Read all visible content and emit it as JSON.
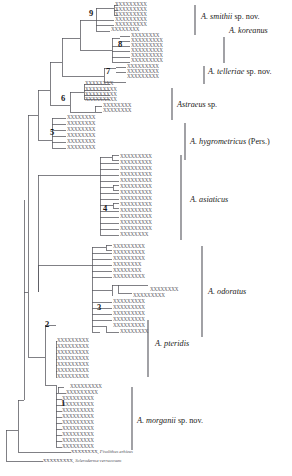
{
  "figure": {
    "type": "phylogenetic-cladogram",
    "background_color": "#ffffff",
    "branch_color": "#55555c",
    "tip_label_color": "#5a5a62",
    "bracket_color": "#55555c"
  },
  "node_numbers": [
    {
      "id": "node-9",
      "label": "9",
      "x": 89,
      "y": 14
    },
    {
      "id": "node-8",
      "label": "8",
      "x": 118,
      "y": 45
    },
    {
      "id": "node-7",
      "label": "7",
      "x": 106,
      "y": 72
    },
    {
      "id": "node-6",
      "label": "6",
      "x": 61,
      "y": 99
    },
    {
      "id": "node-5",
      "label": "5",
      "x": 50,
      "y": 133
    },
    {
      "id": "node-4",
      "label": "4",
      "x": 103,
      "y": 209
    },
    {
      "id": "node-3",
      "label": "3",
      "x": 97,
      "y": 308
    },
    {
      "id": "node-2",
      "label": "2",
      "x": 45,
      "y": 325
    },
    {
      "id": "node-1",
      "label": "1",
      "x": 61,
      "y": 404
    }
  ],
  "clades": [
    {
      "id": "clade-smithii",
      "label_html": "<i>A. smithii</i> sp. nov.",
      "label_text": "A. smithii sp. nov.",
      "x": 201,
      "y": 17,
      "bar_x": 195,
      "bar_y1": 5,
      "bar_y2": 35
    },
    {
      "id": "clade-koreanus",
      "label_html": "<i>A. koreanus</i>",
      "label_text": "A. koreanus",
      "x": 229,
      "y": 31,
      "bar_x": 224,
      "bar_y1": 37,
      "bar_y2": 63
    },
    {
      "id": "clade-telleriae",
      "label_html": "<i>A. telleriae</i> sp. nov.",
      "label_text": "A. telleriae sp. nov.",
      "x": 208,
      "y": 72,
      "bar_x": 204,
      "bar_y1": 66,
      "bar_y2": 84
    },
    {
      "id": "clade-astraeus-sp",
      "label_html": "<i>Astraeus</i> sp.",
      "label_text": "Astraeus sp.",
      "x": 177,
      "y": 105,
      "bar_x": 172,
      "bar_y1": 88,
      "bar_y2": 120
    },
    {
      "id": "clade-hygrometricus",
      "label_html": "<i>A. hygrometricus</i> (Pers.)",
      "label_text": "A. hygrometricus (Pers.)",
      "x": 190,
      "y": 142,
      "bar_x": 185,
      "bar_y1": 123,
      "bar_y2": 160
    },
    {
      "id": "clade-asiaticus",
      "label_html": "<i>A. asiaticus</i>",
      "label_text": "A. asiaticus",
      "x": 190,
      "y": 200,
      "bar_x": 181,
      "bar_y1": 155,
      "bar_y2": 240
    },
    {
      "id": "clade-odoratus",
      "label_html": "<i>A. odoratus</i>",
      "label_text": "A. odoratus",
      "x": 208,
      "y": 292,
      "bar_x": 202,
      "bar_y1": 246,
      "bar_y2": 337
    },
    {
      "id": "clade-pteridis",
      "label_html": "<i>A. pteridis</i>",
      "label_text": "A. pteridis",
      "x": 155,
      "y": 344,
      "bar_x": 148,
      "bar_y1": 320,
      "bar_y2": 377
    },
    {
      "id": "clade-morganii",
      "label_html": "<i>A. morganii</i> sp. nov.",
      "label_text": "A. morganii sp. nov.",
      "x": 137,
      "y": 421,
      "bar_x": 132,
      "bar_y1": 387,
      "bar_y2": 450
    }
  ],
  "outgroups": [
    {
      "id": "outgroup-pisolithus",
      "tip_code": "XXXXXXXX,",
      "taxon": "Pisolithus arhizus",
      "x": 71,
      "y": 452
    },
    {
      "id": "outgroup-scleroderma",
      "tip_code": "XXXXXXXXX,",
      "taxon": "Scleroderma verrucosum",
      "x": 43,
      "y": 461
    }
  ],
  "tips": [
    {
      "id": "t1",
      "code": "XXXXXXXXX",
      "x": 115,
      "y": 5
    },
    {
      "id": "t2",
      "code": "XXXXXXXXX",
      "x": 115,
      "y": 10
    },
    {
      "id": "t3",
      "code": "XXXXXXXXX",
      "x": 115,
      "y": 15
    },
    {
      "id": "t4",
      "code": "XXXXXXXXX",
      "x": 115,
      "y": 20
    },
    {
      "id": "t5",
      "code": "XXXXXXXXX",
      "x": 115,
      "y": 25
    },
    {
      "id": "t6",
      "code": "XXXXXXXX",
      "x": 111,
      "y": 30
    },
    {
      "id": "t7",
      "code": "XXXXXXXX",
      "x": 131,
      "y": 36
    },
    {
      "id": "t8",
      "code": "XXXXXXXXX",
      "x": 131,
      "y": 41
    },
    {
      "id": "t9",
      "code": "XXXXXXXXX",
      "x": 131,
      "y": 46
    },
    {
      "id": "t10",
      "code": "XXXXXXXXX",
      "x": 131,
      "y": 51
    },
    {
      "id": "t11",
      "code": "XXXXXXXXX",
      "x": 131,
      "y": 56
    },
    {
      "id": "t12",
      "code": "XXXXXXXXX",
      "x": 131,
      "y": 61
    },
    {
      "id": "t13",
      "code": "XXXXXXXXX",
      "x": 127,
      "y": 67
    },
    {
      "id": "t14",
      "code": "XXXXXXXXX",
      "x": 127,
      "y": 72
    },
    {
      "id": "t15",
      "code": "XXXXXXXXX",
      "x": 127,
      "y": 77
    },
    {
      "id": "t16",
      "code": "XXXXXXXX",
      "x": 85,
      "y": 84
    },
    {
      "id": "t17",
      "code": "XXXXXXXXX",
      "x": 85,
      "y": 90
    },
    {
      "id": "t18",
      "code": "XXXXXXXXX",
      "x": 85,
      "y": 95
    },
    {
      "id": "t19",
      "code": "XXXXXXXXX",
      "x": 85,
      "y": 100
    },
    {
      "id": "t20",
      "code": "XXXXXXXX",
      "x": 103,
      "y": 106
    },
    {
      "id": "t21",
      "code": "XXXXXXXX",
      "x": 103,
      "y": 111
    },
    {
      "id": "t22",
      "code": "XXXXXXXX",
      "x": 67,
      "y": 118
    },
    {
      "id": "t23",
      "code": "XXXXXXXX",
      "x": 67,
      "y": 124
    },
    {
      "id": "t24",
      "code": "XXXXXXXX",
      "x": 67,
      "y": 130
    },
    {
      "id": "t25",
      "code": "XXXXXXXX",
      "x": 67,
      "y": 136
    },
    {
      "id": "t26",
      "code": "XXXXXXXX",
      "x": 67,
      "y": 142
    },
    {
      "id": "t27",
      "code": "XXXXXXXX",
      "x": 67,
      "y": 148
    },
    {
      "id": "t28",
      "code": "XXXXXXXXX",
      "x": 120,
      "y": 157
    },
    {
      "id": "t29",
      "code": "XXXXXXXXX",
      "x": 120,
      "y": 163
    },
    {
      "id": "t30",
      "code": "XXXXXXXXX",
      "x": 120,
      "y": 169
    },
    {
      "id": "t31",
      "code": "XXXXXXXXX",
      "x": 120,
      "y": 175
    },
    {
      "id": "t32",
      "code": "XXXXXXXXX",
      "x": 120,
      "y": 181
    },
    {
      "id": "t33",
      "code": "XXXXXXXXX",
      "x": 120,
      "y": 187
    },
    {
      "id": "t34",
      "code": "XXXXXXXXX",
      "x": 120,
      "y": 193
    },
    {
      "id": "t35",
      "code": "XXXXXXXXX",
      "x": 120,
      "y": 199
    },
    {
      "id": "t36",
      "code": "XXXXXXXXX",
      "x": 120,
      "y": 205
    },
    {
      "id": "t37",
      "code": "XXXXXXXXX",
      "x": 120,
      "y": 211
    },
    {
      "id": "t38",
      "code": "XXXXXXXXX",
      "x": 120,
      "y": 217
    },
    {
      "id": "t39",
      "code": "XXXXXXXXX",
      "x": 120,
      "y": 223
    },
    {
      "id": "t40",
      "code": "XXXXXXXXX",
      "x": 120,
      "y": 229
    },
    {
      "id": "t41",
      "code": "XXXXXXXX",
      "x": 120,
      "y": 235
    },
    {
      "id": "t42",
      "code": "XXXXXXXXX",
      "x": 113,
      "y": 247
    },
    {
      "id": "t43",
      "code": "XXXXXXXXX",
      "x": 113,
      "y": 253
    },
    {
      "id": "t44",
      "code": "XXXXXXXXX",
      "x": 113,
      "y": 259
    },
    {
      "id": "t45",
      "code": "XXXXXXXX",
      "x": 113,
      "y": 265
    },
    {
      "id": "t46",
      "code": "XXXXXXXX",
      "x": 113,
      "y": 271
    },
    {
      "id": "t47",
      "code": "XXXXXXXXX",
      "x": 113,
      "y": 277
    },
    {
      "id": "t48",
      "code": "XXXXXXXX",
      "x": 150,
      "y": 290
    },
    {
      "id": "t49",
      "code": "XXXXXXXXX",
      "x": 133,
      "y": 296
    },
    {
      "id": "t50",
      "code": "XXXXXXXXX",
      "x": 113,
      "y": 302
    },
    {
      "id": "t51",
      "code": "XXXXXXXXX",
      "x": 113,
      "y": 308
    },
    {
      "id": "t52",
      "code": "XXXXXXXXX",
      "x": 113,
      "y": 314
    },
    {
      "id": "t53",
      "code": "XXXXXXXXX",
      "x": 113,
      "y": 320
    },
    {
      "id": "t54",
      "code": "XXXXXXXXX",
      "x": 113,
      "y": 326
    },
    {
      "id": "t55",
      "code": "XXXXXXXX",
      "x": 120,
      "y": 332
    },
    {
      "id": "t56",
      "code": "XXXXXXXXX",
      "x": 57,
      "y": 341
    },
    {
      "id": "t57",
      "code": "XXXXXXXXX",
      "x": 57,
      "y": 347
    },
    {
      "id": "t58",
      "code": "XXXXXXXXX",
      "x": 57,
      "y": 353
    },
    {
      "id": "t59",
      "code": "XXXXXXXXX",
      "x": 57,
      "y": 359
    },
    {
      "id": "t60",
      "code": "XXXXXXXXX",
      "x": 57,
      "y": 365
    },
    {
      "id": "t61",
      "code": "XXXXXXXXX",
      "x": 57,
      "y": 371
    },
    {
      "id": "t62",
      "code": "XXXXXXXXX",
      "x": 57,
      "y": 377
    },
    {
      "id": "t63",
      "code": "XXXXXXXXX",
      "x": 70,
      "y": 387
    },
    {
      "id": "t64",
      "code": "XXXXXXXXX",
      "x": 66,
      "y": 393
    },
    {
      "id": "t65",
      "code": "XXXXXXXXX",
      "x": 62,
      "y": 399
    },
    {
      "id": "t66",
      "code": "XXXXXXXXX",
      "x": 62,
      "y": 405
    },
    {
      "id": "t67",
      "code": "XXXXXXXXX",
      "x": 62,
      "y": 411
    },
    {
      "id": "t68",
      "code": "XXXXXXXXX",
      "x": 62,
      "y": 417
    },
    {
      "id": "t69",
      "code": "XXXXXXXXX",
      "x": 62,
      "y": 423
    },
    {
      "id": "t70",
      "code": "XXXXXXXXX",
      "x": 62,
      "y": 429
    },
    {
      "id": "t71",
      "code": "XXXXXXXXX",
      "x": 62,
      "y": 435
    },
    {
      "id": "t72",
      "code": "XXXXXXXXX",
      "x": 62,
      "y": 441
    },
    {
      "id": "t73",
      "code": "XXXXXXXXX",
      "x": 62,
      "y": 447
    }
  ],
  "branches": [
    {
      "d": "M6 430 L6 461"
    },
    {
      "d": "M6 461 L43 461"
    },
    {
      "d": "M6 430 L18 430"
    },
    {
      "d": "M18 400 L18 452"
    },
    {
      "d": "M18 452 L71 452"
    },
    {
      "d": "M18 400 L24 400"
    },
    {
      "d": "M24 292 L24 400"
    },
    {
      "d": "M24 292 L28 292"
    },
    {
      "d": "M28 292 L28 357"
    },
    {
      "d": "M28 357 L45 357"
    },
    {
      "d": "M45 325 L45 385"
    },
    {
      "d": "M45 325 L56 325"
    },
    {
      "d": "M56 341 L56 377"
    },
    {
      "d": "M56 341 L57 341"
    },
    {
      "d": "M56 347 L57 347"
    },
    {
      "d": "M56 353 L57 353"
    },
    {
      "d": "M56 359 L57 359"
    },
    {
      "d": "M56 365 L57 365"
    },
    {
      "d": "M56 371 L57 371"
    },
    {
      "d": "M56 377 L57 377"
    },
    {
      "d": "M45 385 L56 385"
    },
    {
      "d": "M56 385 L56 447"
    },
    {
      "d": "M56 393 L58 393"
    },
    {
      "d": "M58 387 L58 393"
    },
    {
      "d": "M58 387 L64 387"
    },
    {
      "d": "M58 393 L66 393"
    },
    {
      "d": "M56 399 L62 399"
    },
    {
      "d": "M56 405 L62 405"
    },
    {
      "d": "M56 411 L62 411"
    },
    {
      "d": "M56 417 L62 417"
    },
    {
      "d": "M56 423 L62 423"
    },
    {
      "d": "M56 429 L62 429"
    },
    {
      "d": "M56 435 L62 435"
    },
    {
      "d": "M56 441 L62 441"
    },
    {
      "d": "M56 447 L62 447"
    },
    {
      "d": "M28 115 L28 292"
    },
    {
      "d": "M28 115 L38 115"
    },
    {
      "d": "M38 90 L38 140"
    },
    {
      "d": "M38 140 L52 140"
    },
    {
      "d": "M52 118 L52 148"
    },
    {
      "d": "M52 118 L66 118"
    },
    {
      "d": "M52 124 L66 124"
    },
    {
      "d": "M52 130 L66 130"
    },
    {
      "d": "M52 136 L66 136"
    },
    {
      "d": "M52 142 L66 142"
    },
    {
      "d": "M52 148 L66 148"
    },
    {
      "d": "M38 90 L50 90"
    },
    {
      "d": "M50 62 L50 105"
    },
    {
      "d": "M50 105 L70 105"
    },
    {
      "d": "M70 92 L70 112"
    },
    {
      "d": "M70 92 L84 92"
    },
    {
      "d": "M84 84 L84 99"
    },
    {
      "d": "M84 84 L110 84"
    },
    {
      "d": "M84 90 L110 90"
    },
    {
      "d": "M84 95 L110 95"
    },
    {
      "d": "M84 99 L110 99"
    },
    {
      "d": "M70 112 L95 112"
    },
    {
      "d": "M95 106 L95 112"
    },
    {
      "d": "M95 106 L102 106"
    },
    {
      "d": "M95 112 L102 112"
    },
    {
      "d": "M50 62 L62 62"
    },
    {
      "d": "M62 38 L62 76"
    },
    {
      "d": "M62 76 L104 76"
    },
    {
      "d": "M104 68 L104 82"
    },
    {
      "d": "M104 68 L116 68"
    },
    {
      "d": "M116 67 L126 67"
    },
    {
      "d": "M116 72 L126 72"
    },
    {
      "d": "M104 82 L126 82"
    },
    {
      "d": "M62 38 L80 38"
    },
    {
      "d": "M80 20 L80 50"
    },
    {
      "d": "M80 50 L112 50"
    },
    {
      "d": "M112 38 L112 62"
    },
    {
      "d": "M112 38 L120 38"
    },
    {
      "d": "M120 36 L130 36"
    },
    {
      "d": "M120 41 L130 41"
    },
    {
      "d": "M112 46 L120 46"
    },
    {
      "d": "M120 46 L130 46"
    },
    {
      "d": "M112 51 L122 51"
    },
    {
      "d": "M122 51 L130 51"
    },
    {
      "d": "M112 57 L130 57"
    },
    {
      "d": "M112 62 L130 62"
    },
    {
      "d": "M80 20 L96 20"
    },
    {
      "d": "M96 8 L96 31"
    },
    {
      "d": "M96 8 L114 8"
    },
    {
      "d": "M114 5 L114 15"
    },
    {
      "d": "M114 5 L118 5"
    },
    {
      "d": "M114 10 L118 10"
    },
    {
      "d": "M114 15 L118 15"
    },
    {
      "d": "M96 20 L114 20"
    },
    {
      "d": "M96 25 L114 25"
    },
    {
      "d": "M96 31 L110 31"
    },
    {
      "d": "M38 175 L38 292"
    },
    {
      "d": "M24 200 L24 292"
    },
    {
      "d": "M38 175 L100 175"
    },
    {
      "d": "M100 157 L100 235"
    },
    {
      "d": "M100 157 L112 157"
    },
    {
      "d": "M112 155 L112 160"
    },
    {
      "d": "M112 155 L119 155"
    },
    {
      "d": "M112 160 L119 160"
    },
    {
      "d": "M100 163 L119 163"
    },
    {
      "d": "M100 169 L119 169"
    },
    {
      "d": "M100 175 L119 175"
    },
    {
      "d": "M100 181 L119 181"
    },
    {
      "d": "M100 187 L113 187"
    },
    {
      "d": "M113 185 L113 190"
    },
    {
      "d": "M113 185 L119 185"
    },
    {
      "d": "M113 190 L119 190"
    },
    {
      "d": "M100 193 L119 193"
    },
    {
      "d": "M100 199 L119 199"
    },
    {
      "d": "M100 205 L113 205"
    },
    {
      "d": "M113 203 L113 208"
    },
    {
      "d": "M113 203 L119 203"
    },
    {
      "d": "M113 208 L119 208"
    },
    {
      "d": "M100 211 L119 211"
    },
    {
      "d": "M100 217 L119 217"
    },
    {
      "d": "M100 223 L119 223"
    },
    {
      "d": "M100 229 L119 229"
    },
    {
      "d": "M100 235 L119 235"
    },
    {
      "d": "M38 265 L38 292"
    },
    {
      "d": "M38 265 L92 265"
    },
    {
      "d": "M92 247 L92 332"
    },
    {
      "d": "M92 247 L106 247"
    },
    {
      "d": "M106 245 L106 250"
    },
    {
      "d": "M106 245 L112 245"
    },
    {
      "d": "M106 250 L112 250"
    },
    {
      "d": "M92 253 L112 253"
    },
    {
      "d": "M92 259 L112 259"
    },
    {
      "d": "M92 265 L112 265"
    },
    {
      "d": "M92 271 L112 271"
    },
    {
      "d": "M92 277 L112 277"
    },
    {
      "d": "M92 290 L112 290"
    },
    {
      "d": "M112 285 L112 296"
    },
    {
      "d": "M112 285 L118 285"
    },
    {
      "d": "M118 285 L118 293"
    },
    {
      "d": "M118 285 L148 285"
    },
    {
      "d": "M118 293 L132 293"
    },
    {
      "d": "M92 302 L112 302"
    },
    {
      "d": "M92 308 L112 308"
    },
    {
      "d": "M92 314 L112 314"
    },
    {
      "d": "M92 320 L112 320"
    },
    {
      "d": "M92 326 L106 326"
    },
    {
      "d": "M106 326 L106 332"
    },
    {
      "d": "M106 332 L119 332"
    },
    {
      "d": "M92 332 L100 332"
    }
  ]
}
